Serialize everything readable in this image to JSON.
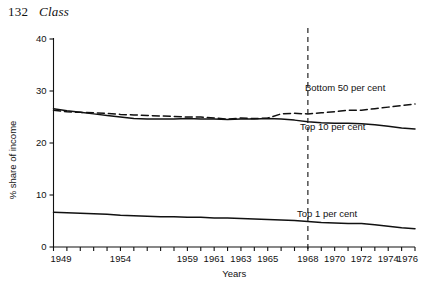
{
  "page": {
    "folio": "132",
    "running_head": "Class"
  },
  "chart_data": {
    "type": "line",
    "title": "",
    "xlabel": "Years",
    "ylabel": "% share of income",
    "xlim": [
      1949,
      1976
    ],
    "ylim": [
      0,
      40
    ],
    "yticks": [
      0,
      10,
      20,
      30,
      40
    ],
    "ytick_labels": [
      "0",
      "10",
      "20",
      "30",
      "40"
    ],
    "xticks": [
      1949,
      1950,
      1951,
      1952,
      1953,
      1954,
      1955,
      1956,
      1957,
      1958,
      1959,
      1960,
      1961,
      1962,
      1963,
      1964,
      1965,
      1966,
      1967,
      1968,
      1969,
      1970,
      1971,
      1972,
      1973,
      1974,
      1975,
      1976
    ],
    "xtick_labels": [
      {
        "year": 1949,
        "label": "1949"
      },
      {
        "year": 1954,
        "label": "1954"
      },
      {
        "year": 1959,
        "label": "1959"
      },
      {
        "year": 1961,
        "label": "1961"
      },
      {
        "year": 1963,
        "label": "1963"
      },
      {
        "year": 1965,
        "label": "1965"
      },
      {
        "year": 1968,
        "label": "1968"
      },
      {
        "year": 1970,
        "label": "1970"
      },
      {
        "year": 1972,
        "label": "1972"
      },
      {
        "year": 1974,
        "label": "1974"
      },
      {
        "year": 1976,
        "label": "1976"
      }
    ],
    "grid": false,
    "legend_position": "inline-right",
    "annotations": [
      {
        "name": "reference-line",
        "type": "vline",
        "x": 1968,
        "style": "dashed"
      }
    ],
    "x": [
      1949,
      1950,
      1951,
      1952,
      1953,
      1954,
      1955,
      1956,
      1957,
      1958,
      1959,
      1960,
      1961,
      1962,
      1963,
      1964,
      1965,
      1966,
      1967,
      1968,
      1969,
      1970,
      1971,
      1972,
      1973,
      1974,
      1975,
      1976
    ],
    "series": [
      {
        "name": "Bottom 50 per cent",
        "label": "Bottom 50 per cent",
        "style": "dashed",
        "color": "#111111",
        "values": [
          26.3,
          26.0,
          25.9,
          25.8,
          25.7,
          25.5,
          25.4,
          25.3,
          25.2,
          25.1,
          25.0,
          25.0,
          24.8,
          24.6,
          24.8,
          24.7,
          24.8,
          25.6,
          25.7,
          25.6,
          25.8,
          26.0,
          26.3,
          26.3,
          26.6,
          26.9,
          27.2,
          27.5
        ]
      },
      {
        "name": "Top 10 per cent",
        "label": "Top 10 per cent",
        "style": "solid",
        "color": "#111111",
        "values": [
          26.6,
          26.2,
          25.9,
          25.6,
          25.3,
          25.0,
          24.7,
          24.6,
          24.6,
          24.6,
          24.7,
          24.6,
          24.6,
          24.5,
          24.6,
          24.6,
          24.7,
          24.6,
          24.4,
          24.1,
          23.9,
          23.8,
          23.8,
          23.7,
          23.5,
          23.2,
          22.9,
          22.7
        ]
      },
      {
        "name": "Top 1 per cent",
        "label": "Top 1 per cent",
        "style": "solid",
        "color": "#111111",
        "values": [
          6.7,
          6.6,
          6.5,
          6.4,
          6.3,
          6.1,
          6.0,
          5.9,
          5.8,
          5.8,
          5.7,
          5.7,
          5.6,
          5.6,
          5.5,
          5.4,
          5.3,
          5.2,
          5.1,
          4.9,
          4.7,
          4.6,
          4.5,
          4.5,
          4.3,
          4.0,
          3.7,
          3.5
        ]
      }
    ]
  }
}
